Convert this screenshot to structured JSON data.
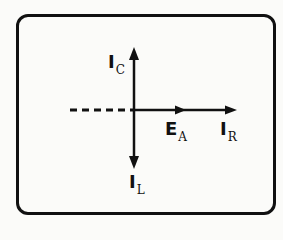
{
  "diagram": {
    "title": "",
    "type": "phasor-diagram",
    "colors": {
      "line": "#111111",
      "background": "#fbfbf9"
    },
    "vectors": [
      {
        "id": "IC",
        "label_main": "I",
        "label_sub": "C",
        "direction": "up"
      },
      {
        "id": "IL",
        "label_main": "I",
        "label_sub": "L",
        "direction": "down"
      },
      {
        "id": "EA",
        "label_main": "E",
        "label_sub": "A",
        "direction": "right"
      },
      {
        "id": "IR",
        "label_main": "I",
        "label_sub": "R",
        "direction": "right"
      }
    ],
    "reference_line": {
      "style": "dashed",
      "direction": "left"
    }
  }
}
